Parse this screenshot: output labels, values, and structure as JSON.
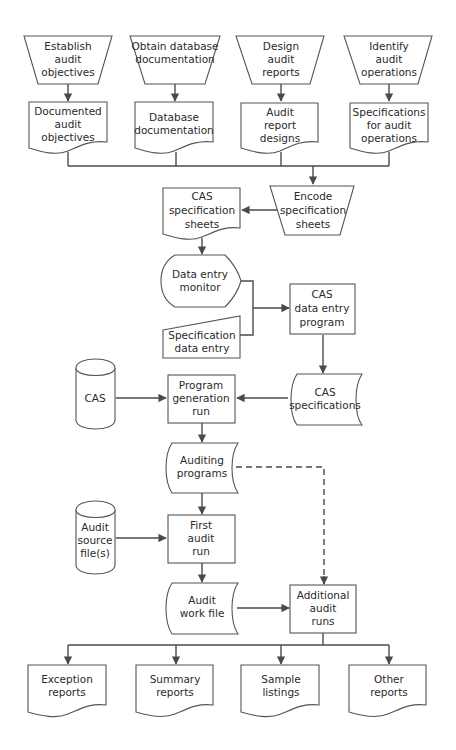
{
  "diagram": {
    "type": "flowchart",
    "colors": {
      "stroke": "#555555",
      "line": "#4a4a4a",
      "text": "#2a2a2a",
      "background": "#ffffff"
    },
    "nodes": {
      "establish": {
        "shape": "manual-operation",
        "lines": [
          "Establish",
          "audit",
          "objectives"
        ]
      },
      "obtain": {
        "shape": "manual-operation",
        "lines": [
          "Obtain database",
          "documentation"
        ]
      },
      "design": {
        "shape": "manual-operation",
        "lines": [
          "Design",
          "audit",
          "reports"
        ]
      },
      "identify": {
        "shape": "manual-operation",
        "lines": [
          "Identify",
          "audit",
          "operations"
        ]
      },
      "documented": {
        "shape": "document",
        "lines": [
          "Documented",
          "audit",
          "objectives"
        ]
      },
      "dbdoc": {
        "shape": "document",
        "lines": [
          "Database",
          "documentation"
        ]
      },
      "reportdesigns": {
        "shape": "document",
        "lines": [
          "Audit",
          "report",
          "designs"
        ]
      },
      "specops": {
        "shape": "document",
        "lines": [
          "Specifications",
          "for audit",
          "operations"
        ]
      },
      "encode": {
        "shape": "manual-operation",
        "lines": [
          "Encode",
          "specification",
          "sheets"
        ]
      },
      "cassheets": {
        "shape": "document",
        "lines": [
          "CAS",
          "specification",
          "sheets"
        ]
      },
      "monitor": {
        "shape": "display",
        "lines": [
          "Data entry",
          "monitor"
        ]
      },
      "specentry": {
        "shape": "manual-input",
        "lines": [
          "Specification",
          "data entry"
        ]
      },
      "casprogram": {
        "shape": "process",
        "lines": [
          "CAS",
          "data entry",
          "program"
        ]
      },
      "cas": {
        "shape": "disk",
        "lines": [
          "CAS"
        ]
      },
      "progrun": {
        "shape": "process",
        "lines": [
          "Program",
          "generation",
          "run"
        ]
      },
      "casspecs": {
        "shape": "stored-data",
        "lines": [
          "CAS",
          "specifications"
        ]
      },
      "auditprog": {
        "shape": "stored-data",
        "lines": [
          "Auditing",
          "programs"
        ]
      },
      "sourcefile": {
        "shape": "disk",
        "lines": [
          "Audit",
          "source",
          "file(s)"
        ]
      },
      "firstrun": {
        "shape": "process",
        "lines": [
          "First",
          "audit",
          "run"
        ]
      },
      "workfile": {
        "shape": "stored-data",
        "lines": [
          "Audit",
          "work file"
        ]
      },
      "additional": {
        "shape": "process",
        "lines": [
          "Additional",
          "audit",
          "runs"
        ]
      },
      "exception": {
        "shape": "document",
        "lines": [
          "Exception",
          "reports"
        ]
      },
      "summary": {
        "shape": "document",
        "lines": [
          "Summary",
          "reports"
        ]
      },
      "sample": {
        "shape": "document",
        "lines": [
          "Sample",
          "listings"
        ]
      },
      "other": {
        "shape": "document",
        "lines": [
          "Other",
          "reports"
        ]
      }
    },
    "edges": [
      {
        "from": "establish",
        "to": "documented"
      },
      {
        "from": "obtain",
        "to": "dbdoc"
      },
      {
        "from": "design",
        "to": "reportdesigns"
      },
      {
        "from": "identify",
        "to": "specops"
      },
      {
        "from": "documented,dbdoc,reportdesigns,specops",
        "to": "encode"
      },
      {
        "from": "encode",
        "to": "cassheets"
      },
      {
        "from": "cassheets",
        "to": "monitor"
      },
      {
        "from": "monitor,specentry",
        "to": "casprogram"
      },
      {
        "from": "casprogram",
        "to": "casspecs"
      },
      {
        "from": "cas",
        "to": "progrun"
      },
      {
        "from": "casspecs",
        "to": "progrun"
      },
      {
        "from": "progrun",
        "to": "auditprog"
      },
      {
        "from": "auditprog",
        "to": "firstrun"
      },
      {
        "from": "auditprog",
        "to": "additional",
        "style": "dashed"
      },
      {
        "from": "sourcefile",
        "to": "firstrun"
      },
      {
        "from": "firstrun",
        "to": "workfile"
      },
      {
        "from": "workfile",
        "to": "additional"
      },
      {
        "from": "additional",
        "to": "exception,summary,sample,other"
      }
    ]
  }
}
